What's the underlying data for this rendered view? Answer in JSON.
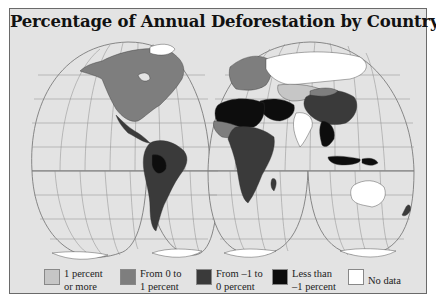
{
  "title": "Percentage of Annual Deforestation by Country, 1990-1995",
  "colors": {
    "background": "#e3e3e3",
    "ocean": "#e3e3e3",
    "graticule": "#7a7a7a",
    "class_1_or_more": "#c6c6c6",
    "class_0_to_1": "#7e7e7e",
    "class_minus1_to_0": "#3a3a3a",
    "class_less_than_minus1": "#0d0d0d",
    "class_no_data": "#ffffff"
  },
  "legend": {
    "items": [
      {
        "line1": "1 percent",
        "line2": "or more",
        "color": "#c6c6c6"
      },
      {
        "line1": "From 0 to",
        "line2": "1 percent",
        "color": "#7e7e7e"
      },
      {
        "line1": "From –1 to",
        "line2": "0 percent",
        "color": "#3a3a3a"
      },
      {
        "line1": "Less than",
        "line2": "–1 percent",
        "color": "#0d0d0d"
      },
      {
        "line1": "No data",
        "line2": "",
        "color": "#ffffff"
      }
    ]
  },
  "map": {
    "projection": "interrupted (four lobes)",
    "regions": [
      {
        "name": "North America",
        "class": "From 0 to 1 percent"
      },
      {
        "name": "Central America",
        "class": "From –1 to 0 percent"
      },
      {
        "name": "South America",
        "class": "From –1 to 0 percent"
      },
      {
        "name": "Europe",
        "class": "From 0 to 1 percent"
      },
      {
        "name": "Russia",
        "class": "No data"
      },
      {
        "name": "North Africa",
        "class": "Less than –1 percent"
      },
      {
        "name": "Sub-Saharan Africa",
        "class": "From –1 to 0 percent"
      },
      {
        "name": "Middle East",
        "class": "Less than –1 percent"
      },
      {
        "name": "China",
        "class": "From –1 to 0 percent"
      },
      {
        "name": "India",
        "class": "No data"
      },
      {
        "name": "Southeast Asia",
        "class": "Less than –1 percent"
      },
      {
        "name": "Australia",
        "class": "No data"
      },
      {
        "name": "Antarctica",
        "class": "No data"
      }
    ]
  }
}
